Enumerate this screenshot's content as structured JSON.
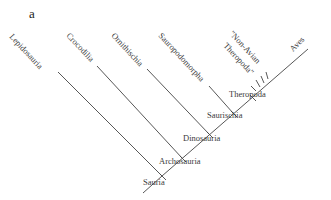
{
  "panel_label": "a",
  "diagram_type": "cladogram",
  "taxa": {
    "lepidosauria": "Lepidosauria",
    "crocodilia": "Crocodilia",
    "ornithischia": "Ornithischia",
    "sauropodomorpha": "Sauropodomorpha",
    "non_avian_1": "\"Non-Avian",
    "non_avian_2": "Theropoda\"",
    "aves": "Aves"
  },
  "nodes": {
    "theropoda": "Theropoda",
    "saurischia": "Saurischia",
    "dinosauria": "Dinosauria",
    "archosauria": "Archosauria",
    "sauria": "Sauria"
  },
  "colors": {
    "line": "#444444",
    "text": "#3a3a3a"
  }
}
